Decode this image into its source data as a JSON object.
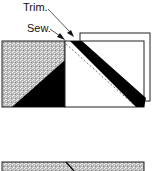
{
  "diagram": {
    "labels": {
      "trim": "Trim.",
      "sew": "Sew."
    },
    "colors": {
      "fabric_gray": "#c8c8c8",
      "fabric_black": "#000000",
      "fabric_white": "#ffffff",
      "outline": "#222222"
    },
    "parts": [
      "gray-square-with-black-triangle",
      "white-square",
      "offset-white-square",
      "black-diagonal-band",
      "dashed-sew-line",
      "bottom-gray-strip"
    ]
  }
}
